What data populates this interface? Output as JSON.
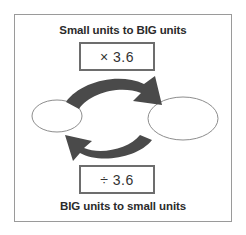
{
  "figure": {
    "caption_top": "Small units to BIG units",
    "caption_bottom": "BIG units to small units",
    "multiply_label": "× 3.6",
    "divide_label": "÷ 3.6",
    "conversion_factor": "3.6",
    "colors": {
      "frame_border": "#9a9a9a",
      "box_border": "#6d6d6d",
      "arrow_fill": "#4a4a4a",
      "ellipse_stroke": "#8d8d8d",
      "text": "#2b2b2b",
      "background": "#ffffff"
    },
    "nodes": {
      "left_label": "",
      "right_label": ""
    },
    "arrows": {
      "top_direction": "left-to-right",
      "bottom_direction": "right-to-left"
    }
  }
}
